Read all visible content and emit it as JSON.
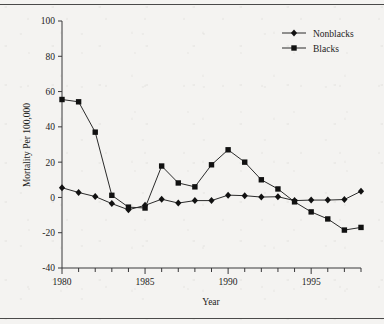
{
  "figure": {
    "background_color": "#f4f3f1",
    "ink_color": "#1c1c1c"
  },
  "axes": {
    "y_label": "Mortality Per 100,000",
    "x_label": "Year",
    "y_ticks": [
      "100",
      "80",
      "60",
      "40",
      "20",
      "0",
      "-20",
      "-40"
    ],
    "x_ticks": [
      "1980",
      "1985",
      "1990",
      "1995"
    ]
  },
  "legend": {
    "position": "top-right",
    "entries": [
      {
        "label": "Nonblacks",
        "marker": "diamond"
      },
      {
        "label": "Blacks",
        "marker": "square"
      }
    ]
  },
  "chart_data": {
    "type": "line",
    "title": "",
    "xlabel": "Year",
    "ylabel": "Mortality Per 100,000",
    "xlim": [
      1980,
      1998
    ],
    "ylim": [
      -40,
      100
    ],
    "xticks": [
      1980,
      1985,
      1990,
      1995
    ],
    "yticks": [
      -40,
      -20,
      0,
      20,
      40,
      60,
      80,
      100
    ],
    "grid": false,
    "legend_position": "top-right",
    "x": [
      1980,
      1981,
      1982,
      1983,
      1984,
      1985,
      1986,
      1987,
      1988,
      1989,
      1990,
      1991,
      1992,
      1993,
      1994,
      1995,
      1996,
      1997,
      1998
    ],
    "series": [
      {
        "name": "Nonblacks",
        "marker": "diamond",
        "values": [
          5.5,
          2.8,
          0.5,
          -3.5,
          -7.0,
          -4.5,
          -1.0,
          -3.2,
          -1.8,
          -1.8,
          1.3,
          1.0,
          0.2,
          0.4,
          -1.8,
          -1.5,
          -1.5,
          -1.2,
          3.5
        ]
      },
      {
        "name": "Blacks",
        "marker": "square",
        "values": [
          55.5,
          54.2,
          37.0,
          1.2,
          -5.5,
          -6.0,
          17.8,
          8.2,
          6.0,
          18.5,
          27.0,
          20.0,
          10.0,
          4.8,
          -2.5,
          -8.2,
          -12.2,
          -18.5,
          -17.0
        ]
      }
    ]
  }
}
